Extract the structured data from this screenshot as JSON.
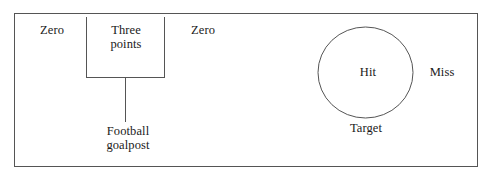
{
  "figure": {
    "stroke_color": "#555555",
    "text_color": "#1a1a1a",
    "background": "#ffffff",
    "border": {
      "x": 14,
      "y": 13,
      "width": 464,
      "height": 154
    }
  },
  "goalpost": {
    "left_post_x": 86,
    "right_post_x": 164,
    "post_top_y": 17,
    "crossbar_y": 77,
    "stem_x": 125,
    "stem_bottom_y": 122,
    "labels": {
      "zero_left": "Zero",
      "three_points": "Three\npoints",
      "zero_right": "Zero",
      "caption": "Football\ngoalpost"
    }
  },
  "target": {
    "circle": {
      "cx": 365.5,
      "cy": 72.5,
      "rx": 47.5,
      "ry": 45.5
    },
    "labels": {
      "hit": "Hit",
      "miss": "Miss",
      "caption": "Target"
    }
  }
}
